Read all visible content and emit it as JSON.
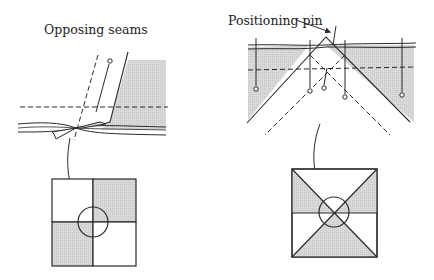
{
  "figure": {
    "left_panel": {
      "title": "Opposing seams",
      "subject": "two seams with allowances pressed in opposite directions, pinned through the seam junction",
      "result_block": "four-patch square with alternating shaded quadrants, seam intersection circled"
    },
    "right_panel": {
      "callout": "Positioning pin",
      "subject": "point of a triangle aligned to a seam intersection with a positioning pin",
      "result_block": "square divided by diagonals and a horizontal seam, shaded triangles, intersection circled"
    },
    "colors": {
      "line": "#2a2a2a",
      "shade": "#d4d4d4",
      "background": "#ffffff"
    }
  }
}
